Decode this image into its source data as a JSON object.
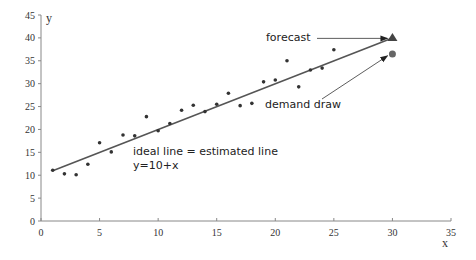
{
  "chart_data": {
    "type": "scatter",
    "title": "",
    "xlabel": "x",
    "ylabel": "y",
    "xlim": [
      0,
      35
    ],
    "ylim": [
      0,
      45
    ],
    "x_ticks": [
      0,
      5,
      10,
      15,
      20,
      25,
      30,
      35
    ],
    "y_ticks": [
      0,
      5,
      10,
      15,
      20,
      25,
      30,
      35,
      40,
      45
    ],
    "grid": false,
    "legend": null,
    "series": [
      {
        "name": "observations",
        "marker": "dot",
        "x": [
          1,
          2,
          3,
          4,
          5,
          6,
          7,
          8,
          9,
          10,
          11,
          12,
          13,
          14,
          15,
          16,
          17,
          18,
          19,
          20,
          21,
          22,
          23,
          24,
          25
        ],
        "y": [
          11.1,
          10.3,
          10.1,
          12.4,
          17.1,
          15.1,
          18.8,
          18.6,
          22.8,
          19.7,
          21.3,
          24.2,
          25.3,
          23.9,
          25.5,
          27.9,
          25.2,
          25.7,
          30.4,
          30.8,
          35.0,
          29.3,
          33.0,
          33.4,
          37.4
        ]
      },
      {
        "name": "estimated line",
        "type": "line",
        "equation": "y=10+x",
        "x": [
          1,
          30
        ],
        "y": [
          11,
          40
        ]
      },
      {
        "name": "forecast",
        "marker": "triangle",
        "x": [
          30
        ],
        "y": [
          40
        ]
      },
      {
        "name": "demand draw",
        "marker": "circle",
        "x": [
          30
        ],
        "y": [
          36.5
        ]
      }
    ],
    "annotations": [
      {
        "text": "forecast",
        "arrow_to": [
          30,
          40
        ]
      },
      {
        "text": "demand draw",
        "arrow_to": [
          30,
          36.5
        ]
      },
      {
        "text": "ideal line = estimated line"
      },
      {
        "text": "y=10+x"
      }
    ]
  },
  "labels": {
    "x_axis": "x",
    "y_axis": "y",
    "forecast": "forecast",
    "demand_draw": "demand draw",
    "ideal_line": "ideal line = estimated line",
    "equation": "y=10+x"
  },
  "colors": {
    "axis": "#888888",
    "line": "#555555",
    "points": "#333333",
    "forecast_marker": "#444444",
    "demand_marker": "#666666"
  }
}
